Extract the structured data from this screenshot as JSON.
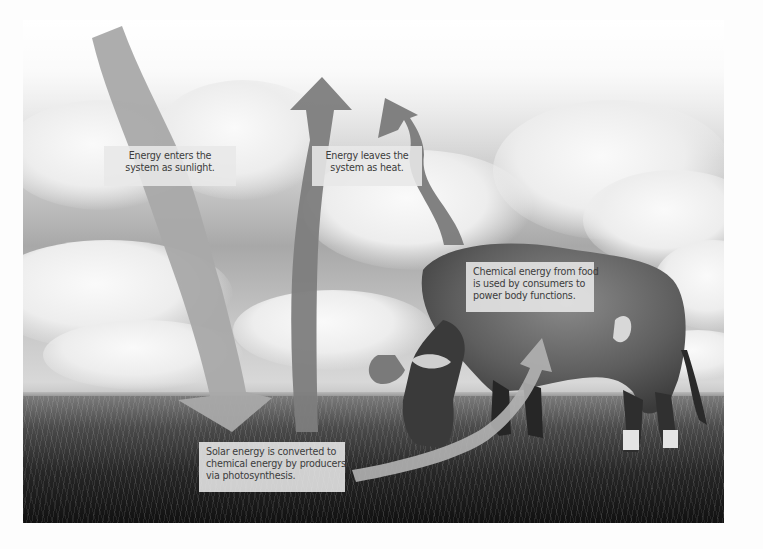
{
  "diagram": {
    "scene": "Cow grazing on grassland under a cloudy sky",
    "colors": {
      "background": "#fdfdfd",
      "arrow_sunlight": "#a9a9a9",
      "arrow_heat": "#7d7d7d",
      "arrow_chemical": "#b3b3b3",
      "label_bg": "#e8e8e8",
      "label_text": "#3c3c3c"
    },
    "arrows": [
      {
        "id": "sunlight-arrow",
        "direction": "down",
        "meaning": "Energy enters as sunlight"
      },
      {
        "id": "heat-arrow-1",
        "direction": "up",
        "meaning": "Energy leaves as heat (from producers)"
      },
      {
        "id": "heat-arrow-2",
        "direction": "up",
        "meaning": "Energy leaves as heat (from consumer)"
      },
      {
        "id": "chemical-arrow",
        "direction": "up-right",
        "meaning": "Chemical energy passed to consumer"
      }
    ],
    "labels": {
      "sunlight": {
        "lines": [
          "Energy enters the",
          "system as sunlight."
        ]
      },
      "heat": {
        "lines": [
          "Energy leaves the",
          "system as heat."
        ]
      },
      "consumers": {
        "lines": [
          "Chemical energy from food",
          "is used by consumers to",
          "power body functions."
        ]
      },
      "producers": {
        "lines": [
          "Solar energy is converted to",
          "chemical energy by producers",
          "via photosynthesis."
        ]
      }
    }
  }
}
